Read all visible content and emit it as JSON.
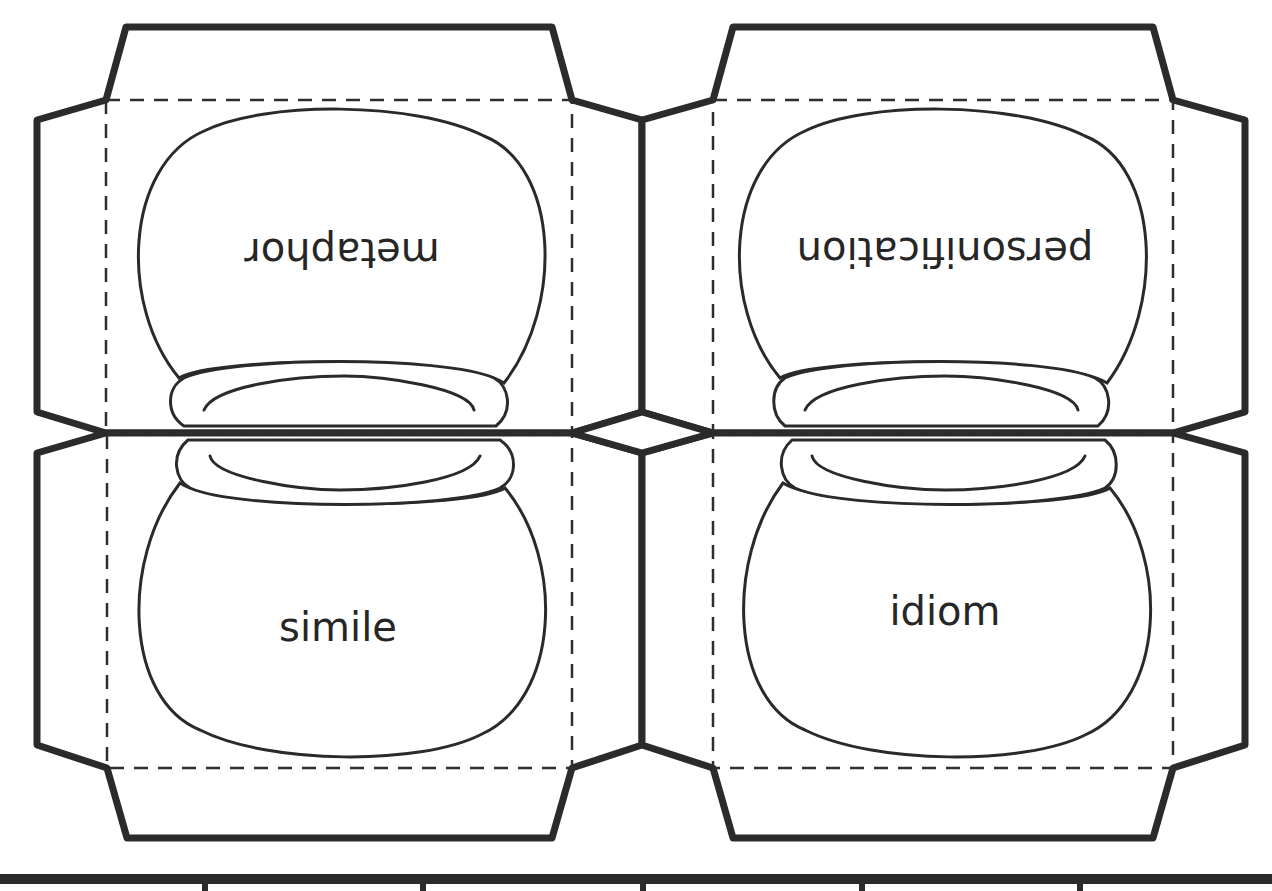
{
  "worksheet": {
    "cards": [
      {
        "id": "top-left",
        "term": "metaphor",
        "orientation": "upside-down"
      },
      {
        "id": "top-right",
        "term": "personification",
        "orientation": "upside-down"
      },
      {
        "id": "bottom-left",
        "term": "simile",
        "orientation": "upright"
      },
      {
        "id": "bottom-right",
        "term": "idiom",
        "orientation": "upright"
      }
    ],
    "colors": {
      "line": "#2b2b2b",
      "background": "#ffffff"
    },
    "bottom_strip": {
      "divider_count": 5
    }
  }
}
